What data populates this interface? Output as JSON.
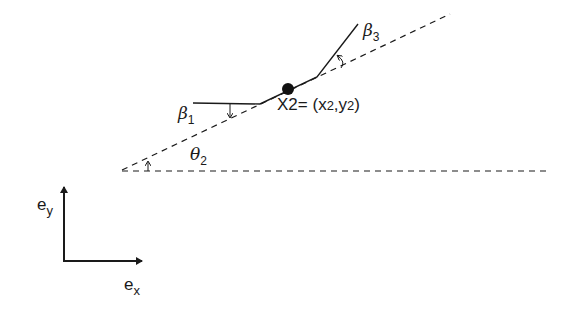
{
  "diagram": {
    "type": "link-chain angle definition",
    "labels": {
      "beta1": {
        "symbol": "β",
        "sub": "1"
      },
      "beta3": {
        "symbol": "β",
        "sub": "3"
      },
      "theta2": {
        "symbol": "θ",
        "sub": "2"
      },
      "point": {
        "name": "X",
        "name_sub": "2",
        "eq": "= (",
        "x": "x",
        "x_sub": "2",
        "comma": ",",
        "y": "y",
        "y_sub": "2",
        "close": ")"
      },
      "ex": {
        "symbol": "e",
        "sub": "x"
      },
      "ey": {
        "symbol": "e",
        "sub": "y"
      }
    },
    "colors": {
      "stroke": "#1a1a1a",
      "background": "#ffffff"
    }
  }
}
